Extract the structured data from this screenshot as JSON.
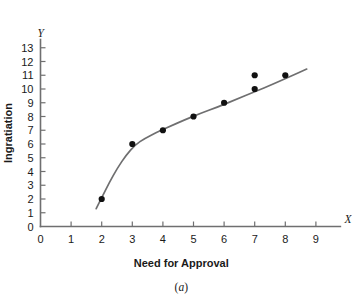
{
  "chart_data": {
    "type": "scatter",
    "title": "",
    "subtitle": "",
    "xlabel": "Need for Approval",
    "ylabel": "Ingratiation",
    "x_axis_letter": "X",
    "y_axis_letter": "Y",
    "caption": "(a)",
    "caption_prefix": "(",
    "caption_letter": "a",
    "caption_suffix": ")",
    "xlim": [
      0,
      9.8
    ],
    "ylim": [
      0,
      13.6
    ],
    "x_ticks": [
      0,
      1,
      2,
      3,
      4,
      5,
      6,
      7,
      8,
      9
    ],
    "x_tick_labels": [
      "0",
      "1",
      "2",
      "3",
      "4",
      "5",
      "6",
      "7",
      "8",
      "9"
    ],
    "y_ticks": [
      0,
      1,
      2,
      3,
      4,
      5,
      6,
      7,
      8,
      9,
      10,
      11,
      12,
      13
    ],
    "y_tick_labels": [
      "0",
      "1",
      "2",
      "3",
      "4",
      "5",
      "6",
      "7",
      "8",
      "9",
      "10",
      "11",
      "12",
      "13"
    ],
    "grid": false,
    "legend": false,
    "legend_position": "none",
    "point_color": "#111111",
    "curve_color": "#6f6f70",
    "axis_color": "#6f6f70",
    "points": [
      {
        "x": 2,
        "y": 2
      },
      {
        "x": 3,
        "y": 6
      },
      {
        "x": 4,
        "y": 7
      },
      {
        "x": 5,
        "y": 8
      },
      {
        "x": 6,
        "y": 9
      },
      {
        "x": 7,
        "y": 10
      },
      {
        "x": 7,
        "y": 11
      },
      {
        "x": 8,
        "y": 11
      }
    ],
    "fit_curve": {
      "label": "curvilinear fit",
      "x": [
        1.82,
        2.0,
        2.25,
        2.5,
        2.8,
        3.1,
        3.4,
        3.8,
        4.2,
        4.7,
        5.2,
        5.8,
        6.4,
        7.0,
        7.6,
        8.2,
        8.7
      ],
      "y": [
        1.3,
        2.1,
        3.2,
        4.2,
        5.2,
        5.95,
        6.4,
        6.85,
        7.25,
        7.75,
        8.2,
        8.7,
        9.25,
        9.8,
        10.35,
        10.95,
        11.45
      ]
    }
  }
}
